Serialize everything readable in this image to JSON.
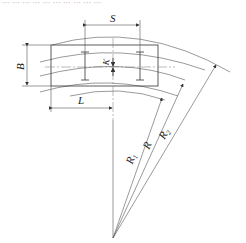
{
  "caption_fragment": "··· ··· ··· ···  ··· ··· ··· ··· ··· ···",
  "labels": {
    "S": "S",
    "B": "B",
    "K": "K",
    "L": "L",
    "R1": "R",
    "R1_sub": "1",
    "R": "R",
    "R2": "R",
    "R2_sub": "2"
  },
  "colors": {
    "line": "#333333",
    "background": "#ffffff"
  }
}
